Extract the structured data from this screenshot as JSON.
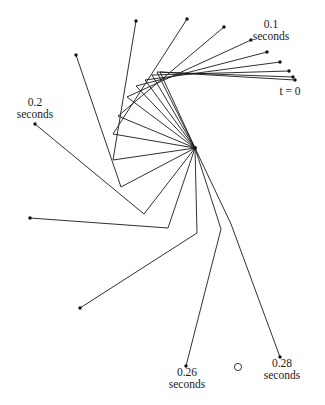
{
  "figure": {
    "labels": {
      "t0": "t = 0",
      "t01_value": "0.1",
      "t01_unit": "seconds",
      "t02_value": "0.2",
      "t02_unit": "seconds",
      "t026_value": "0.26",
      "t026_unit": "seconds",
      "t028_value": "0.28",
      "t028_unit": "seconds"
    },
    "marker": "open-circle",
    "snapshot_count": 15
  }
}
